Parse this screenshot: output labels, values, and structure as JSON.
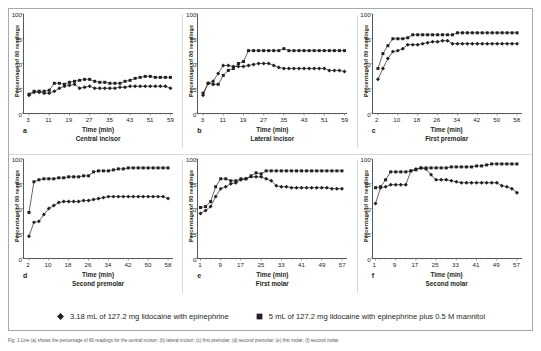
{
  "figure": {
    "ylabel": "Percentage of 80 readings",
    "xlabel": "Time (min)",
    "yticks": [
      0,
      25,
      50,
      75,
      100
    ],
    "ylim": [
      0,
      100
    ],
    "caption": "Fig. 1 Line (a) shows the percentage of 80 readings for the central incisor; (b) lateral incisor; (c) first premolar; (d) second premolar; (e) first molar; (f) second molar."
  },
  "legend": {
    "position": "bottom-center",
    "items": [
      {
        "marker": "diamond",
        "color": "#231f20",
        "label": "3.18 mL of 127.2 mg lidocaine with epinephrine"
      },
      {
        "marker": "square",
        "color": "#231f20",
        "label": "5 mL of 127.2 mg lidocaine with epinephrine plus 0.5 M mannitol"
      }
    ]
  },
  "chart_data": [
    {
      "type": "line",
      "panel": "a",
      "title": "Central incisor",
      "xlabel": "Time (min)",
      "ylabel": "Percentage of 80 readings",
      "ylim": [
        0,
        100
      ],
      "xlim": [
        1,
        60
      ],
      "xticks": [
        3,
        11,
        19,
        27,
        35,
        43,
        51,
        59
      ],
      "grid": false,
      "x": [
        3,
        5,
        7,
        9,
        11,
        13,
        15,
        17,
        19,
        21,
        23,
        25,
        27,
        29,
        31,
        33,
        35,
        37,
        39,
        41,
        43,
        45,
        47,
        49,
        51,
        53,
        55,
        57,
        59
      ],
      "series": [
        {
          "name": "3.18 mL of 127.2 mg lidocaine with epinephrine",
          "marker": "diamond",
          "values": [
            18,
            21,
            21,
            20,
            20,
            22,
            25,
            27,
            28,
            29,
            25,
            26,
            27,
            25,
            25,
            25,
            25,
            25,
            26,
            26,
            27,
            27,
            27,
            27,
            27,
            27,
            27,
            27,
            25
          ]
        },
        {
          "name": "5 mL of 127.2 mg lidocaine with epinephrine plus 0.5 M mannitol",
          "marker": "square",
          "values": [
            19,
            22,
            22,
            22,
            23,
            30,
            30,
            29,
            31,
            32,
            33,
            34,
            34,
            32,
            31,
            31,
            30,
            30,
            30,
            32,
            33,
            35,
            36,
            37,
            37,
            36,
            36,
            36,
            36
          ]
        }
      ]
    },
    {
      "type": "line",
      "panel": "b",
      "title": "Lateral incisor",
      "xlabel": "Time (min)",
      "ylabel": "Percentage of 80 readings",
      "ylim": [
        0,
        100
      ],
      "xlim": [
        1,
        60
      ],
      "xticks": [
        3,
        11,
        19,
        27,
        35,
        43,
        51,
        59
      ],
      "grid": false,
      "x": [
        3,
        5,
        7,
        9,
        11,
        13,
        15,
        17,
        19,
        21,
        23,
        25,
        27,
        29,
        31,
        33,
        35,
        37,
        39,
        41,
        43,
        45,
        47,
        49,
        51,
        53,
        55,
        57,
        59
      ],
      "series": [
        {
          "name": "3.18 mL of 127.2 mg lidocaine with epinephrine",
          "marker": "diamond",
          "values": [
            18,
            30,
            32,
            40,
            48,
            48,
            47,
            47,
            47,
            48,
            49,
            50,
            50,
            50,
            48,
            46,
            45,
            45,
            45,
            45,
            45,
            45,
            45,
            45,
            45,
            43,
            43,
            43,
            42
          ]
        },
        {
          "name": "5 mL of 127.2 mg lidocaine with epinephrine plus 0.5 M mannitol",
          "marker": "square",
          "values": [
            20,
            30,
            29,
            29,
            38,
            43,
            45,
            50,
            52,
            63,
            63,
            63,
            63,
            63,
            63,
            63,
            65,
            63,
            63,
            63,
            63,
            63,
            63,
            63,
            63,
            63,
            63,
            63,
            63
          ]
        }
      ]
    },
    {
      "type": "line",
      "panel": "c",
      "title": "First premolar",
      "xlabel": "Time (min)",
      "ylabel": "Percentage of 80 readings",
      "ylim": [
        0,
        100
      ],
      "xlim": [
        0,
        60
      ],
      "xticks": [
        2,
        10,
        18,
        26,
        34,
        42,
        50,
        58
      ],
      "grid": false,
      "x": [
        2,
        4,
        6,
        8,
        10,
        12,
        14,
        16,
        18,
        20,
        22,
        24,
        26,
        28,
        30,
        32,
        34,
        36,
        38,
        40,
        42,
        44,
        46,
        48,
        50,
        52,
        54,
        56,
        58
      ],
      "series": [
        {
          "name": "3.18 mL of 127.2 mg lidocaine with epinephrine",
          "marker": "diamond",
          "values": [
            34,
            45,
            55,
            62,
            63,
            65,
            69,
            69,
            69,
            70,
            71,
            72,
            72,
            73,
            73,
            70,
            70,
            70,
            70,
            70,
            70,
            70,
            70,
            70,
            70,
            70,
            70,
            70,
            70
          ]
        },
        {
          "name": "5 mL of 127.2 mg lidocaine with epinephrine plus 0.5 M mannitol",
          "marker": "square",
          "values": [
            45,
            60,
            68,
            75,
            75,
            75,
            76,
            79,
            79,
            79,
            79,
            79,
            79,
            79,
            79,
            79,
            81,
            81,
            81,
            81,
            81,
            81,
            81,
            81,
            81,
            81,
            81,
            81,
            81
          ]
        }
      ]
    },
    {
      "type": "line",
      "panel": "d",
      "title": "Second premolar",
      "xlabel": "Time (min)",
      "ylabel": "Percentage of 80 readings",
      "ylim": [
        0,
        100
      ],
      "xlim": [
        0,
        60
      ],
      "xticks": [
        2,
        10,
        18,
        26,
        34,
        42,
        50,
        58
      ],
      "grid": false,
      "x": [
        2,
        4,
        6,
        8,
        10,
        12,
        14,
        16,
        18,
        20,
        22,
        24,
        26,
        28,
        30,
        32,
        34,
        36,
        38,
        40,
        42,
        44,
        46,
        48,
        50,
        52,
        54,
        56,
        58
      ],
      "series": [
        {
          "name": "3.18 mL of 127.2 mg lidocaine with epinephrine",
          "marker": "diamond",
          "values": [
            22,
            36,
            37,
            44,
            50,
            53,
            56,
            57,
            57,
            57,
            57,
            58,
            58,
            59,
            60,
            61,
            62,
            62,
            62,
            62,
            62,
            62,
            62,
            62,
            62,
            62,
            62,
            62,
            60
          ]
        },
        {
          "name": "5 mL of 127.2 mg lidocaine with epinephrine plus 0.5 M mannitol",
          "marker": "square",
          "values": [
            46,
            77,
            79,
            80,
            80,
            80,
            81,
            81,
            82,
            82,
            82,
            83,
            83,
            87,
            88,
            88,
            88,
            89,
            90,
            90,
            91,
            91,
            91,
            91,
            91,
            91,
            91,
            91,
            91
          ]
        }
      ]
    },
    {
      "type": "line",
      "panel": "e",
      "title": "First molar",
      "xlabel": "Time (min)",
      "ylabel": "Percentage of 80 readings",
      "ylim": [
        0,
        100
      ],
      "xlim": [
        0,
        59
      ],
      "xticks": [
        1,
        9,
        17,
        25,
        33,
        41,
        49,
        57
      ],
      "grid": false,
      "x": [
        1,
        3,
        5,
        7,
        9,
        11,
        13,
        15,
        17,
        19,
        21,
        23,
        25,
        27,
        29,
        31,
        33,
        35,
        37,
        39,
        41,
        43,
        45,
        47,
        49,
        51,
        53,
        55,
        57
      ],
      "series": [
        {
          "name": "3.18 mL of 127.2 mg lidocaine with epinephrine",
          "marker": "diamond",
          "values": [
            45,
            48,
            52,
            62,
            70,
            72,
            75,
            76,
            79,
            80,
            82,
            82,
            82,
            80,
            78,
            73,
            72,
            72,
            71,
            71,
            71,
            71,
            71,
            71,
            71,
            71,
            70,
            70,
            70
          ]
        },
        {
          "name": "5 mL of 127.2 mg lidocaine with epinephrine plus 0.5 M mannitol",
          "marker": "square",
          "values": [
            51,
            52,
            57,
            72,
            80,
            80,
            78,
            78,
            80,
            80,
            83,
            86,
            85,
            88,
            88,
            88,
            88,
            88,
            88,
            88,
            88,
            88,
            88,
            88,
            88,
            88,
            88,
            88,
            88
          ]
        }
      ]
    },
    {
      "type": "line",
      "panel": "f",
      "title": "Second molar",
      "xlabel": "Time (min)",
      "ylabel": "Percentage of 80 readings",
      "ylim": [
        0,
        100
      ],
      "xlim": [
        0,
        59
      ],
      "xticks": [
        1,
        9,
        17,
        25,
        33,
        41,
        49,
        57
      ],
      "grid": false,
      "x": [
        1,
        3,
        5,
        7,
        9,
        11,
        13,
        15,
        17,
        19,
        21,
        23,
        25,
        27,
        29,
        31,
        33,
        35,
        37,
        39,
        41,
        43,
        45,
        47,
        49,
        51,
        53,
        55,
        57
      ],
      "series": [
        {
          "name": "3.18 mL of 127.2 mg lidocaine with epinephrine",
          "marker": "diamond",
          "values": [
            55,
            71,
            72,
            74,
            74,
            74,
            74,
            88,
            90,
            91,
            90,
            84,
            79,
            79,
            79,
            78,
            77,
            76,
            76,
            76,
            76,
            76,
            76,
            76,
            76,
            73,
            72,
            70,
            66
          ]
        },
        {
          "name": "5 mL of 127.2 mg lidocaine with epinephrine plus 0.5 M mannitol",
          "marker": "square",
          "values": [
            71,
            72,
            79,
            87,
            87,
            87,
            87,
            88,
            89,
            91,
            91,
            91,
            91,
            91,
            91,
            92,
            92,
            92,
            92,
            92,
            93,
            93,
            94,
            95,
            95,
            95,
            95,
            95,
            95
          ]
        }
      ]
    }
  ]
}
